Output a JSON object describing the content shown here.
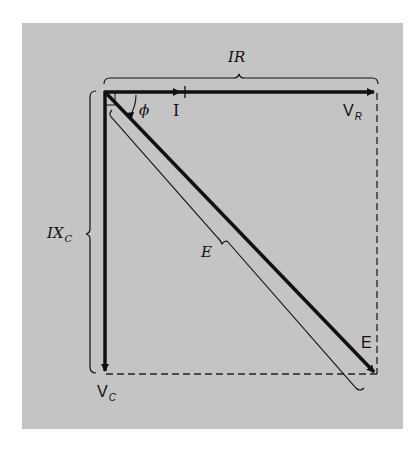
{
  "diagram": {
    "background_color": "#c4c4c4",
    "line_color": "#111111",
    "phasors": [
      {
        "id": "V_R",
        "label_main": "V",
        "label_sub": "R",
        "direction": "right"
      },
      {
        "id": "V_C",
        "label_main": "V",
        "label_sub": "C",
        "direction": "down"
      },
      {
        "id": "E",
        "label_main": "E",
        "direction": "diagonal-down-right"
      },
      {
        "id": "I",
        "label_main": "I",
        "direction": "right"
      }
    ],
    "labels": {
      "ir_brace": "IR",
      "ixc_brace_main": "IX",
      "ixc_brace_sub": "C",
      "angle": "ϕ",
      "current": "I",
      "vr_main": "V",
      "vr_sub": "R",
      "vc_main": "V",
      "vc_sub": "C",
      "e_tip": "E",
      "e_brace": "E"
    }
  }
}
